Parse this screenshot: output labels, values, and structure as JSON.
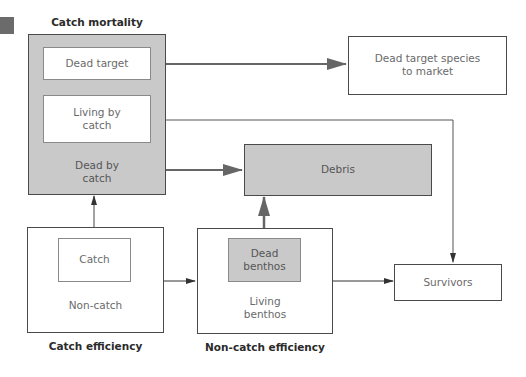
{
  "corner_marker": {
    "color": "#6b6b6b"
  },
  "groups": {
    "catch_mortality": {
      "title": "Catch mortality",
      "items": {
        "dead_target": "Dead target",
        "living_bycatch": "Living by\ncatch",
        "dead_bycatch": "Dead by\ncatch"
      }
    },
    "catch_efficiency": {
      "title": "Catch efficiency",
      "items": {
        "catch": "Catch",
        "non_catch": "Non-catch"
      }
    },
    "non_catch_efficiency": {
      "title": "Non-catch efficiency",
      "items": {
        "dead_benthos": "Dead\nbenthos",
        "living_benthos": "Living\nbenthos"
      }
    }
  },
  "nodes": {
    "market": "Dead target species\nto market",
    "debris": "Debris",
    "survivors": "Survivors"
  },
  "colors": {
    "gray_fill": "#c9c9c9",
    "border": "#4a4a4a",
    "arrow": "#666666",
    "text": "#6a6a6a"
  }
}
